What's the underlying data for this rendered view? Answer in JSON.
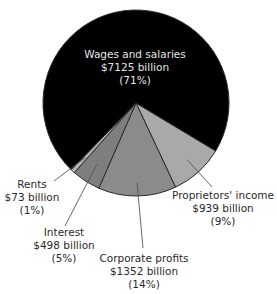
{
  "chart_data": {
    "type": "pie",
    "title": "",
    "unit": "billion",
    "slices": [
      {
        "name": "Proprietors' income",
        "value": 939,
        "percent": 9,
        "value_label": "$939 billion",
        "percent_label": "(9%)",
        "color": "#a9a9a9",
        "label_placement": "outside-lower-right"
      },
      {
        "name": "Corporate profits",
        "value": 1352,
        "percent": 14,
        "value_label": "$1352 billion",
        "percent_label": "(14%)",
        "color": "#8b8b8b",
        "label_placement": "outside-bottom"
      },
      {
        "name": "Interest",
        "value": 498,
        "percent": 5,
        "value_label": "$498 billion",
        "percent_label": "(5%)",
        "color": "#7e7e7e",
        "label_placement": "outside-lower-left"
      },
      {
        "name": "Rents",
        "value": 73,
        "percent": 1,
        "value_label": "$73 billion",
        "percent_label": "(1%)",
        "color": "#b4b4b4",
        "label_placement": "outside-left"
      },
      {
        "name": "Wages and salaries",
        "value": 7125,
        "percent": 71,
        "value_label": "$7125 billion",
        "percent_label": "(71%)",
        "color": "#000000",
        "label_placement": "inside"
      }
    ],
    "legend": "none"
  }
}
